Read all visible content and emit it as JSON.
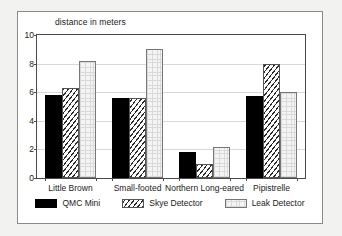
{
  "chart_data": {
    "type": "bar",
    "title": "distance in meters",
    "xlabel": "",
    "ylabel": "distance in meters",
    "ylim": [
      0,
      10
    ],
    "yticks": [
      0,
      2,
      4,
      6,
      8,
      10
    ],
    "ytick_labels": [
      "0",
      "2",
      "4",
      "6",
      "8",
      "10"
    ],
    "grid": true,
    "legend_position": "bottom",
    "categories": [
      "Little Brown",
      "Small-footed",
      "Northern Long-eared",
      "Pipistrelle"
    ],
    "series": [
      {
        "name": "QMC Mini",
        "pattern": "solid-black",
        "color": "#000000",
        "values": [
          5.8,
          5.6,
          1.8,
          5.75
        ]
      },
      {
        "name": "Skye Detector",
        "pattern": "diagonal-hatch",
        "color": "#2a2a2a",
        "values": [
          6.3,
          5.6,
          1.0,
          8.0
        ]
      },
      {
        "name": "Leak Detector",
        "pattern": "light-dotted",
        "color": "#f4f4f4",
        "values": [
          8.2,
          9.0,
          2.2,
          6.0
        ]
      }
    ]
  }
}
